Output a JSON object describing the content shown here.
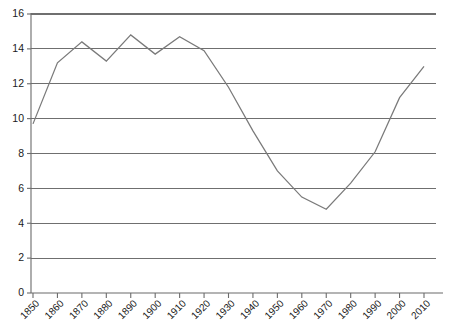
{
  "chart_data": {
    "type": "line",
    "title": "",
    "subtitle": "",
    "xlabel": "",
    "ylabel": "",
    "x": [
      1850,
      1860,
      1870,
      1880,
      1890,
      1900,
      1910,
      1920,
      1930,
      1940,
      1950,
      1960,
      1970,
      1980,
      1990,
      2000,
      2010
    ],
    "categories": [
      "1850",
      "1860",
      "1870",
      "1880",
      "1890",
      "1900",
      "1910",
      "1920",
      "1930",
      "1940",
      "1950",
      "1960",
      "1970",
      "1980",
      "1990",
      "2000",
      "2010"
    ],
    "values": [
      9.7,
      13.2,
      14.4,
      13.3,
      14.8,
      13.7,
      14.7,
      13.9,
      11.8,
      9.3,
      7.0,
      5.5,
      4.8,
      6.3,
      8.1,
      11.2,
      13.0
    ],
    "series": [
      {
        "name": "series-1",
        "color": "#7a7a7a",
        "values": [
          9.7,
          13.2,
          14.4,
          13.3,
          14.8,
          13.7,
          14.7,
          13.9,
          11.8,
          9.3,
          7.0,
          5.5,
          4.8,
          6.3,
          8.1,
          11.2,
          13.0
        ]
      }
    ],
    "ylim": [
      0,
      16
    ],
    "xlim": [
      1850,
      2010
    ],
    "yticks": [
      0,
      2,
      4,
      6,
      8,
      10,
      12,
      14,
      16
    ],
    "ytick_labels": [
      "0",
      "2",
      "4",
      "6",
      "8",
      "10",
      "12",
      "14",
      "16"
    ],
    "xtick_labels": [
      "1850",
      "1860",
      "1870",
      "1880",
      "1890",
      "1900",
      "1910",
      "1920",
      "1930",
      "1940",
      "1950",
      "1960",
      "1970",
      "1980",
      "1990",
      "2000",
      "2010"
    ],
    "grid": {
      "horizontal": true,
      "vertical": false,
      "color": "#6f6f6f"
    },
    "legend": {
      "visible": false,
      "position": "none",
      "entries": []
    },
    "annotations": [],
    "axis_color": "#6b6b6b",
    "background": "#ffffff",
    "xtick_label_rotation": -45
  }
}
